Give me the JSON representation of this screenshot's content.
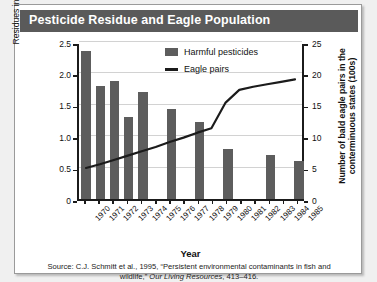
{
  "title": "Pesticide Residue and Eagle Population",
  "source": {
    "prefix": "Source: C.J. Schmitt et al., 1995, “Persistent environmental contaminants in fish and wildlife,” ",
    "journal": "Our Living Resources",
    "suffix": ", 413–416."
  },
  "legend": {
    "bars_label": "Harmful pesticides",
    "line_label": "Eagle pairs"
  },
  "colors": {
    "title_bar": "#5a5a5a",
    "bar_fill": "#5d5d5d",
    "line": "#1b1b1b",
    "axis": "#1b1b1b",
    "grid": "#d2d2d2",
    "card_bg": "#ffffff"
  },
  "chart_data": {
    "type": "bar",
    "title": "Pesticide Residue and Eagle Population",
    "xlabel": "Year",
    "grid": true,
    "legend_position": "top-right",
    "categories": [
      "1970",
      "1971",
      "1972",
      "1973",
      "1974",
      "1975",
      "1976",
      "1977",
      "1978",
      "1979",
      "1980",
      "1981",
      "1982",
      "1983",
      "1984",
      "1985"
    ],
    "y_left": {
      "label": "Residues in U.S. freshewater fish (ppm)",
      "ticks": [
        "0",
        "0.5",
        "1.0",
        "1.5",
        "2.0",
        "2.5"
      ],
      "tick_values": [
        0,
        0.5,
        1.0,
        1.5,
        2.0,
        2.5
      ],
      "ylim": [
        0,
        2.5
      ]
    },
    "y_right": {
      "label": "Number of bald eagle pairs in the conterminuous states (100s)",
      "ticks": [
        "0",
        "5",
        "10",
        "15",
        "20",
        "25"
      ],
      "tick_values": [
        0,
        5,
        10,
        15,
        20,
        25
      ],
      "ylim": [
        0,
        25
      ]
    },
    "series": [
      {
        "name": "Harmful pesticides",
        "type": "bar",
        "axis": "left",
        "unit": "ppm",
        "values": [
          2.35,
          1.8,
          1.88,
          1.3,
          1.7,
          null,
          1.43,
          null,
          1.22,
          null,
          0.8,
          null,
          null,
          0.7,
          null,
          0.6
        ]
      },
      {
        "name": "Eagle pairs",
        "type": "line",
        "axis": "right",
        "unit": "100s of pairs",
        "values": [
          5.0,
          5.6,
          6.3,
          7.0,
          7.7,
          8.4,
          9.2,
          9.9,
          10.7,
          11.4,
          15.5,
          17.6,
          18.1,
          18.5,
          18.9,
          19.3
        ]
      }
    ]
  }
}
